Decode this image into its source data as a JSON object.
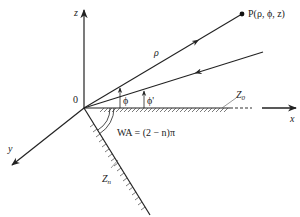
{
  "diagram": {
    "axes": {
      "z_label": "z",
      "x_label": "x",
      "y_label": "y",
      "origin_label": "0"
    },
    "point": {
      "label": "P(ρ, ϕ, z)"
    },
    "radial": {
      "label": "ρ"
    },
    "angles": {
      "phi": "ϕ",
      "phi_prime": "ϕ'"
    },
    "planes": {
      "z0_label": "Z",
      "z0_sub": "0",
      "zn_label": "Z",
      "zn_sub": "n"
    },
    "wedge_angle": {
      "text": "WA = (2 − n)π"
    },
    "colors": {
      "stroke": "#222222",
      "background": "#ffffff"
    }
  }
}
